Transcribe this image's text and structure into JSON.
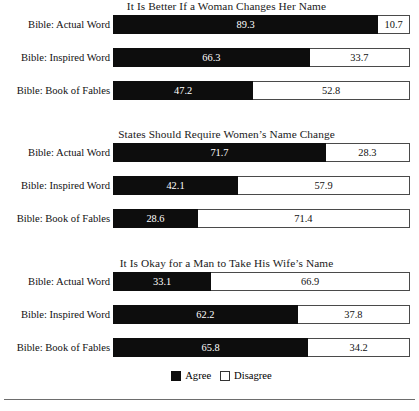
{
  "chart_data": {
    "type": "bar",
    "subtype": "stacked-horizontal-100pct",
    "title": "",
    "xlabel": "",
    "ylabel": "",
    "xlim": [
      0,
      100
    ],
    "grid": false,
    "legend_position": "bottom-center",
    "categories": [
      "Bible: Actual Word",
      "Bible: Inspired Word",
      "Bible: Book of Fables"
    ],
    "series": [
      {
        "name": "Agree",
        "color": "#0d0d0d"
      },
      {
        "name": "Disagree",
        "color": "#ffffff"
      }
    ],
    "panels": [
      {
        "title": "It Is Better If a Woman Changes Her Name",
        "rows": [
          {
            "label": "Bible: Actual Word",
            "agree": 89.3,
            "disagree": 10.7,
            "agree_text": "89.3",
            "disagree_text": "10.7"
          },
          {
            "label": "Bible: Inspired Word",
            "agree": 66.3,
            "disagree": 33.7,
            "agree_text": "66.3",
            "disagree_text": "33.7"
          },
          {
            "label": "Bible: Book of Fables",
            "agree": 47.2,
            "disagree": 52.8,
            "agree_text": "47.2",
            "disagree_text": "52.8"
          }
        ]
      },
      {
        "title": "States Should Require Women’s Name Change",
        "rows": [
          {
            "label": "Bible: Actual Word",
            "agree": 71.7,
            "disagree": 28.3,
            "agree_text": "71.7",
            "disagree_text": "28.3"
          },
          {
            "label": "Bible: Inspired Word",
            "agree": 42.1,
            "disagree": 57.9,
            "agree_text": "42.1",
            "disagree_text": "57.9"
          },
          {
            "label": "Bible: Book of Fables",
            "agree": 28.6,
            "disagree": 71.4,
            "agree_text": "28.6",
            "disagree_text": "71.4"
          }
        ]
      },
      {
        "title": "It Is Okay for a Man to Take His Wife’s Name",
        "rows": [
          {
            "label": "Bible: Actual Word",
            "agree": 33.1,
            "disagree": 66.9,
            "agree_text": "33.1",
            "disagree_text": "66.9"
          },
          {
            "label": "Bible: Inspired Word",
            "agree": 62.2,
            "disagree": 37.8,
            "agree_text": "62.2",
            "disagree_text": "37.8"
          },
          {
            "label": "Bible: Book of Fables",
            "agree": 65.8,
            "disagree": 34.2,
            "agree_text": "65.8",
            "disagree_text": "34.2"
          }
        ]
      }
    ],
    "legend": [
      {
        "label": "Agree",
        "color": "#0d0d0d"
      },
      {
        "label": "Disagree",
        "color": "#ffffff"
      }
    ]
  }
}
